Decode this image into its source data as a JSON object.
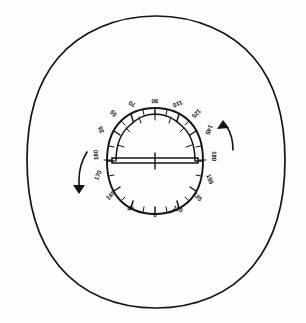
{
  "figure": {
    "style": "hand-drawn-ink-on-paper",
    "ink_color": "#141414",
    "paper_color": "#fdfdfd"
  },
  "outer_circle": {
    "name": "outer boundary circle",
    "center_x": 156,
    "center_y": 162,
    "radius_x": 129,
    "radius_y": 146
  },
  "dial": {
    "name": "graduated compass dial",
    "center_x": 155,
    "center_y": 161,
    "radius_x": 48,
    "radius_y": 53,
    "tick_count_major": 24,
    "tick_count_minor": 24
  },
  "protractor": {
    "name": "inner semicircular protractor arc",
    "center_x": 155,
    "center_y": 161,
    "radius_x": 39,
    "radius_y": 41,
    "span": "upper half, 180 degrees"
  },
  "baseline": {
    "name": "horizontal baseline bar",
    "left_x": 112,
    "right_x": 198,
    "y": 161,
    "center_tick_label": ""
  },
  "degree_labels": [
    {
      "text": "90",
      "x": 155,
      "y": 99,
      "rotation": 182,
      "side": "top-center"
    },
    {
      "text": "70",
      "x": 133,
      "y": 102,
      "rotation": 205,
      "side": "top-left"
    },
    {
      "text": "110",
      "x": 177,
      "y": 102,
      "rotation": 158,
      "side": "top-right"
    },
    {
      "text": "55",
      "x": 115,
      "y": 112,
      "rotation": 228,
      "side": "upper-left"
    },
    {
      "text": "125",
      "x": 195,
      "y": 112,
      "rotation": 135,
      "side": "upper-right"
    },
    {
      "text": "35",
      "x": 103,
      "y": 129,
      "rotation": 250,
      "side": "left-upper"
    },
    {
      "text": "145",
      "x": 207,
      "y": 129,
      "rotation": 112,
      "side": "right-upper"
    },
    {
      "text": "180",
      "x": 98,
      "y": 155,
      "rotation": 268,
      "side": "left-center"
    },
    {
      "text": "180",
      "x": 212,
      "y": 156,
      "rotation": 92,
      "side": "right-center"
    },
    {
      "text": "170",
      "x": 100,
      "y": 176,
      "rotation": 292,
      "side": "left-lower"
    },
    {
      "text": "155",
      "x": 208,
      "y": 180,
      "rotation": 68,
      "side": "right-lower"
    },
    {
      "text": "145",
      "x": 112,
      "y": 197,
      "rotation": 315,
      "side": "lower-left"
    },
    {
      "text": "135",
      "x": 196,
      "y": 198,
      "rotation": 45,
      "side": "lower-right"
    },
    {
      "text": "45",
      "x": 131,
      "y": 210,
      "rotation": 338,
      "side": "bottom-left"
    },
    {
      "text": "110",
      "x": 177,
      "y": 211,
      "rotation": 22,
      "side": "bottom-right"
    },
    {
      "text": "0",
      "x": 155,
      "y": 216,
      "rotation": 0,
      "side": "bottom-center"
    }
  ],
  "arrows": [
    {
      "name": "clockwise-rotation-arrow",
      "position": "right",
      "direction": "up",
      "tip_x": 226,
      "tip_y": 122
    },
    {
      "name": "counterclockwise-rotation-arrow",
      "position": "left",
      "direction": "down",
      "tip_x": 79,
      "tip_y": 192
    }
  ]
}
